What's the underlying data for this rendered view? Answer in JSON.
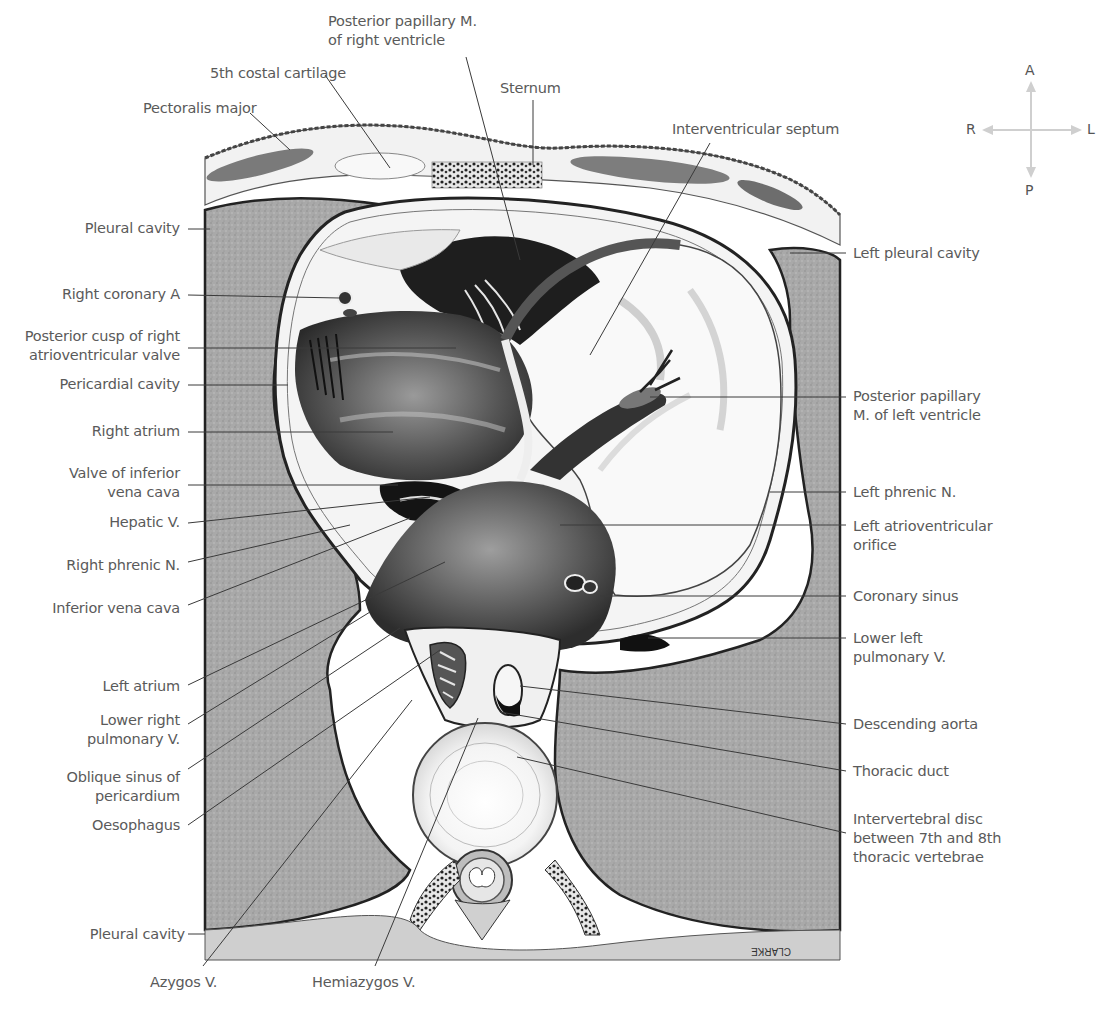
{
  "figure": {
    "type": "anatomical cross-section illustration",
    "signature": "CLARKE",
    "colors": {
      "background": "#ffffff",
      "label_text": "#5a5a5a",
      "leader_line": "#3a3a3a",
      "lung_tissue": "#a8a8a8",
      "dark_chamber": "#2a2a2a",
      "pale_tissue": "#f2f2f2",
      "compass_arrow": "#cccccc"
    }
  },
  "compass": {
    "anterior": "A",
    "posterior": "P",
    "right": "R",
    "left": "L"
  },
  "labels_top": {
    "posterior_papillary_rv_line1": "Posterior papillary M.",
    "posterior_papillary_rv_line2": "of right ventricle",
    "costal_cartilage": "5th costal cartilage",
    "pectoralis_major": "Pectoralis major",
    "sternum": "Sternum",
    "interventricular_septum": "Interventricular septum"
  },
  "labels_left": {
    "pleural_cavity_upper": "Pleural cavity",
    "right_coronary_a": "Right coronary A",
    "posterior_cusp_line1": "Posterior cusp of right",
    "posterior_cusp_line2": "atrioventricular valve",
    "pericardial_cavity": "Pericardial cavity",
    "right_atrium": "Right atrium",
    "valve_ivc_line1": "Valve of inferior",
    "valve_ivc_line2": "vena cava",
    "hepatic_v": "Hepatic V.",
    "right_phrenic_n": "Right phrenic N.",
    "inferior_vena_cava": "Inferior vena cava",
    "left_atrium": "Left atrium",
    "lower_right_pv_line1": "Lower right",
    "lower_right_pv_line2": "pulmonary V.",
    "oblique_sinus_line1": "Oblique sinus of",
    "oblique_sinus_line2": "pericardium",
    "oesophagus": "Oesophagus",
    "pleural_cavity_lower": "Pleural cavity"
  },
  "labels_bottom": {
    "azygos_v": "Azygos V.",
    "hemiazygos_v": "Hemiazygos V."
  },
  "labels_right": {
    "left_pleural_cavity": "Left pleural cavity",
    "posterior_papillary_lv_line1": "Posterior papillary",
    "posterior_papillary_lv_line2": "M. of left ventricle",
    "left_phrenic_n": "Left phrenic N.",
    "left_av_orifice_line1": "Left atrioventricular",
    "left_av_orifice_line2": "orifice",
    "coronary_sinus": "Coronary sinus",
    "lower_left_pv_line1": "Lower left",
    "lower_left_pv_line2": "pulmonary V.",
    "descending_aorta": "Descending aorta",
    "thoracic_duct": "Thoracic duct",
    "iv_disc_line1": "Intervertebral disc",
    "iv_disc_line2": "between 7th and 8th",
    "iv_disc_line3": "thoracic vertebrae"
  }
}
